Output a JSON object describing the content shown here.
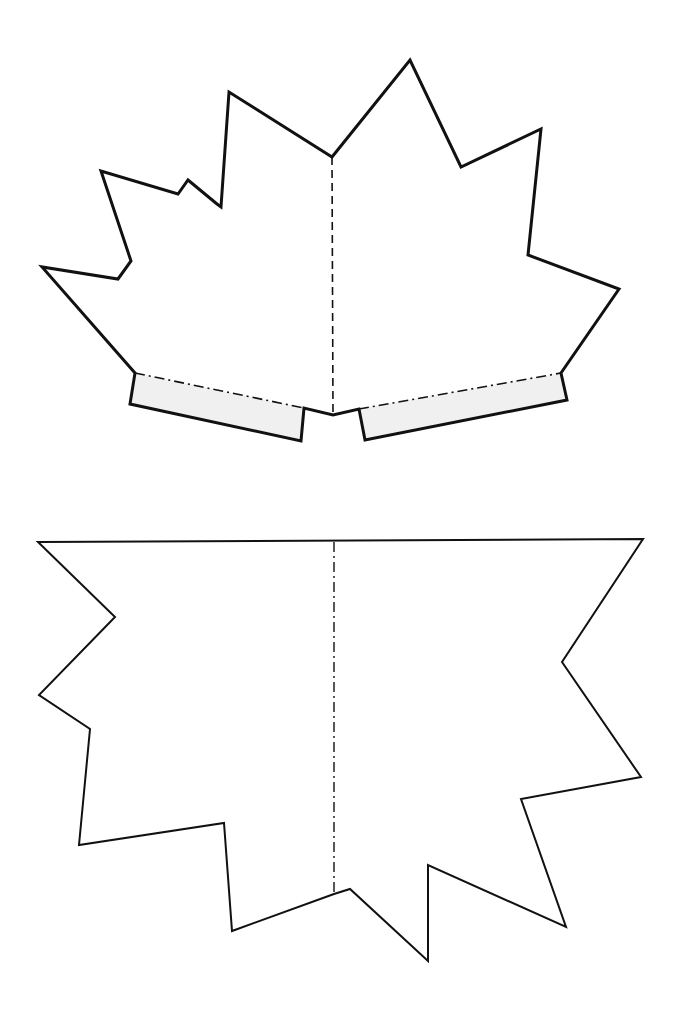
{
  "colors": {
    "background": "#ffffff",
    "outline": "#111111",
    "tab_fill": "#f0f0f0"
  },
  "top_piece": {
    "label": "Leaf pop-up piece with glue tabs",
    "outline_points": "332,157 410,60 461,167 541,129 528,255 619,289 561,373 567,400 365,440 359,409 333,415 304,408 301,441 130,404 135,373 42,267 118,279 131,261 101,171 178,194 188,180 217,204 221,207 229,92",
    "fold_line": {
      "x1": 332,
      "y1": 157,
      "x2": 333,
      "y2": 414,
      "style": "dashed"
    },
    "tabs": [
      {
        "name": "left-glue-tab",
        "points": "135,373 304,408 301,441 130,404",
        "fold": {
          "x1": 135,
          "y1": 373,
          "x2": 304,
          "y2": 408
        }
      },
      {
        "name": "right-glue-tab",
        "points": "359,409 561,373 567,400 365,440",
        "fold": {
          "x1": 359,
          "y1": 409,
          "x2": 561,
          "y2": 373
        }
      }
    ]
  },
  "bottom_piece": {
    "label": "Leaf base piece",
    "outline_points": "38,542 643,539 562,662 641,777 521,799 566,927 428,865 428,961 350,889 334,894 232,931 224,823 79,845 90,729 39,695 115,617",
    "fold_line": {
      "x1": 334,
      "y1": 542,
      "x2": 334,
      "y2": 894,
      "style": "dash-dot"
    }
  }
}
